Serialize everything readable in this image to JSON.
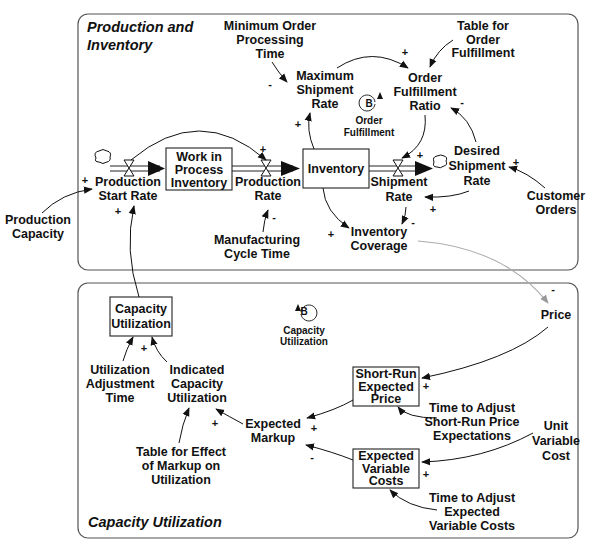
{
  "sectors": {
    "production": {
      "title_line1": "Production and",
      "title_line2": "Inventory"
    },
    "capacity": {
      "title": "Capacity Utilization"
    }
  },
  "stocks": {
    "wip": [
      "Work in",
      "Process",
      "Inventory"
    ],
    "inventory": [
      "Inventory"
    ],
    "capacity_utilization": [
      "Capacity",
      "Utilization"
    ],
    "short_run_expected_price": [
      "Short-Run",
      "Expected",
      "Price"
    ],
    "expected_variable_costs": [
      "Expected",
      "Variable",
      "Costs"
    ]
  },
  "variables": {
    "min_order_processing_time": [
      "Minimum Order",
      "Processing",
      "Time"
    ],
    "table_order_fulfillment": [
      "Table for",
      "Order",
      "Fulfillment"
    ],
    "max_shipment_rate": [
      "Maximum",
      "Shipment",
      "Rate"
    ],
    "order_fulfillment_ratio": [
      "Order",
      "Fulfillment",
      "Ratio"
    ],
    "desired_shipment_rate": [
      "Desired",
      "Shipment",
      "Rate"
    ],
    "customer_orders": [
      "Customer",
      "Orders"
    ],
    "production_start_rate": [
      "Production",
      "Start Rate"
    ],
    "production_rate": [
      "Production",
      "Rate"
    ],
    "shipment_rate": [
      "Shipment",
      "Rate"
    ],
    "production_capacity": [
      "Production",
      "Capacity"
    ],
    "manufacturing_cycle_time": [
      "Manufacturing",
      "Cycle Time"
    ],
    "inventory_coverage": [
      "Inventory",
      "Coverage"
    ],
    "price": [
      "Price"
    ],
    "utilization_adjustment_time": [
      "Utilization",
      "Adjustment",
      "Time"
    ],
    "indicated_capacity_utilization": [
      "Indicated",
      "Capacity",
      "Utilization"
    ],
    "expected_markup": [
      "Expected",
      "Markup"
    ],
    "table_effect_markup": [
      "Table for Effect",
      "of Markup on",
      "Utilization"
    ],
    "time_adjust_price": [
      "Time to Adjust",
      "Short-Run Price",
      "Expectations"
    ],
    "unit_variable_cost": [
      "Unit",
      "Variable",
      "Cost"
    ],
    "time_adjust_costs": [
      "Time to Adjust",
      "Expected",
      "Variable Costs"
    ]
  },
  "loops": {
    "order_fulfillment": {
      "type": "B",
      "name": [
        "Order",
        "Fulfillment"
      ]
    },
    "capacity_utilization": {
      "type": "B",
      "name": [
        "Capacity",
        "Utilization"
      ]
    }
  },
  "signs": {
    "plus": "+",
    "minus": "-"
  }
}
